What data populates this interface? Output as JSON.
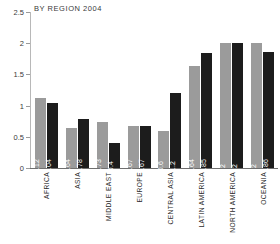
{
  "chart_data": {
    "type": "bar",
    "title": "BY REGION 2004",
    "xlabel": "",
    "ylabel": "",
    "ylim": [
      0,
      2.5
    ],
    "yticks": [
      "0",
      "0.5",
      "1",
      "1.5",
      "2",
      "2.5"
    ],
    "ytick_values": [
      0,
      0.5,
      1,
      1.5,
      2,
      2.5
    ],
    "grid": false,
    "legend": "none",
    "categories": [
      "AFRICA",
      "ASIA",
      "MIDDLE EAST",
      "EUROPE",
      "CENTRAL ASIA",
      "LATIN AMERICA",
      "NORTH AMERICA",
      "OCEANIA"
    ],
    "series": [
      {
        "name": "series-1",
        "color": "#9b9b9b",
        "values": [
          1.12,
          0.64,
          0.73,
          0.67,
          0.6,
          1.64,
          2,
          2
        ],
        "labels": [
          "1.12",
          "0.64",
          "0.73",
          "0.67",
          "0.6",
          "1.64",
          "2",
          "2"
        ]
      },
      {
        "name": "series-2",
        "color": "#1c1c1c",
        "values": [
          1.04,
          0.78,
          0.4,
          0.67,
          1.2,
          1.85,
          2,
          1.86
        ],
        "labels": [
          "1.04",
          "0.78",
          "0.4",
          "0.67",
          "1.2",
          "1.85",
          "2",
          "1.86"
        ]
      }
    ]
  },
  "colors": {
    "series_1": "#9b9b9b",
    "series_2": "#1c1c1c",
    "axis": "#6f6f6f",
    "text": "#2b2b2b",
    "background": "#ffffff"
  }
}
